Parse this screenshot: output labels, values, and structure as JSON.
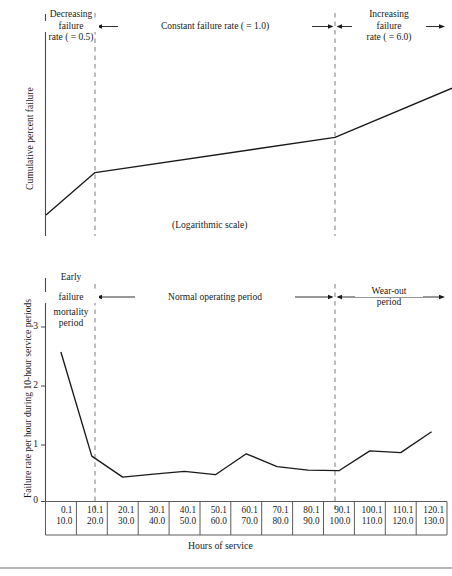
{
  "figure": {
    "colors": {
      "line": "#1a1a1a",
      "axis": "#4a4a4a",
      "dashed": "#8a8a8a",
      "background": "#ffffff"
    },
    "top_panel": {
      "ylabel": "Cumulative percent failure",
      "scale_note": "(Logarithmic scale)",
      "zones": [
        {
          "line1": "Decreasing",
          "line2": "failure",
          "line3": "rate ( = 0.5)"
        },
        {
          "label": "Constant failure rate ( = 1.0)"
        },
        {
          "line1": "Increasing",
          "line2": "failure",
          "line3": "rate ( = 6.0)"
        }
      ]
    },
    "bottom_panel": {
      "ylabel": "Failure rate per hour during 10-hour service periods",
      "xlabel": "Hours of service",
      "yticks": [
        "0",
        "1",
        "2",
        "3"
      ],
      "zones": [
        {
          "line1": "Early",
          "line2": "failure",
          "line3": "or infant",
          "line4": "mortality",
          "line5": "period"
        },
        {
          "label": "Normal operating period"
        },
        {
          "line1": "Wear-out",
          "line2": "period"
        }
      ]
    }
  },
  "chart_data": [
    {
      "type": "line",
      "title": "Cumulative percent failure vs hours of service",
      "xlabel": "",
      "ylabel": "Cumulative percent failure",
      "scale": "logarithmic",
      "grid": false,
      "legend": "none",
      "annotations": [
        "Decreasing failure rate ( = 0.5)",
        "Constant failure rate ( = 1.0)",
        "Increasing failure rate ( = 6.0)",
        "(Logarithmic scale)"
      ],
      "zone_boundaries_hours": [
        20.0,
        100.0
      ],
      "x": [
        0.1,
        20.0,
        100.0,
        130.0
      ],
      "y": [
        12,
        36,
        56,
        84
      ],
      "ylim": [
        0,
        100
      ],
      "xlim": [
        0.1,
        130.0
      ],
      "segment_slopes": [
        "0.5",
        "1.0",
        "6.0"
      ]
    },
    {
      "type": "line",
      "title": "Failure rate per hour during 10-hour service periods vs hours of service",
      "xlabel": "Hours of service",
      "ylabel": "Failure rate per hour during 10-hour service periods",
      "grid": false,
      "legend": "none",
      "ylim": [
        0,
        3.4
      ],
      "yticks": [
        0,
        1,
        2,
        3
      ],
      "annotations": [
        "Early failure or infant mortality period",
        "Normal operating period",
        "Wear-out period"
      ],
      "zone_boundaries_hours": [
        20.0,
        100.0
      ],
      "categories": [
        "0.1\n10.0",
        "10.1\n20.0",
        "20.1\n30.0",
        "30.1\n40.0",
        "40.1\n50.0",
        "50.1\n60.0",
        "60.1\n70.0",
        "70.1\n80.0",
        "80.1\n90.0",
        "90.1\n100.0",
        "100.1\n110.0",
        "110.1\n120.0",
        "120.1\n130.0"
      ],
      "values": [
        2.57,
        0.78,
        0.42,
        0.47,
        0.52,
        0.46,
        0.82,
        0.6,
        0.54,
        0.53,
        0.87,
        0.84,
        1.2
      ]
    }
  ],
  "xaxis_table": {
    "columns": [
      {
        "from": "0.1",
        "to": "10.0"
      },
      {
        "from": "10.1",
        "to": "20.0"
      },
      {
        "from": "20.1",
        "to": "30.0"
      },
      {
        "from": "30.1",
        "to": "40.0"
      },
      {
        "from": "40.1",
        "to": "50.0"
      },
      {
        "from": "50.1",
        "to": "60.0"
      },
      {
        "from": "60.1",
        "to": "70.0"
      },
      {
        "from": "70.1",
        "to": "80.0"
      },
      {
        "from": "80.1",
        "to": "90.0"
      },
      {
        "from": "90.1",
        "to": "100.0"
      },
      {
        "from": "100.1",
        "to": "110.0"
      },
      {
        "from": "110.1",
        "to": "120.0"
      },
      {
        "from": "120.1",
        "to": "130.0"
      }
    ]
  }
}
